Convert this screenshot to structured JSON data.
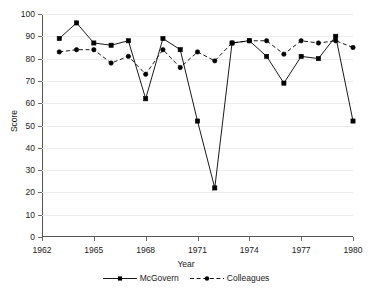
{
  "chart_data": {
    "type": "line",
    "title": "",
    "xlabel": "Year",
    "ylabel": "Score",
    "xlim": [
      1962,
      1980
    ],
    "ylim": [
      0,
      100
    ],
    "grid": true,
    "legend_position": "bottom",
    "xticks": [
      "1962",
      "1965",
      "1968",
      "1971",
      "1974",
      "1977",
      "1980"
    ],
    "xtick_values": [
      1962,
      1965,
      1968,
      1971,
      1974,
      1977,
      1980
    ],
    "yticks": [
      "0",
      "10",
      "20",
      "30",
      "40",
      "50",
      "60",
      "70",
      "80",
      "90",
      "100"
    ],
    "ytick_values": [
      0,
      10,
      20,
      30,
      40,
      50,
      60,
      70,
      80,
      90,
      100
    ],
    "x": [
      1963,
      1964,
      1965,
      1966,
      1967,
      1968,
      1969,
      1970,
      1971,
      1972,
      1973,
      1974,
      1975,
      1976,
      1977,
      1978,
      1979,
      1980
    ],
    "series": [
      {
        "name": "McGovern",
        "style": "solid",
        "marker": "square",
        "color": "#000000",
        "values": [
          89,
          96,
          87,
          86,
          88,
          62,
          89,
          84,
          52,
          22,
          87,
          88,
          81,
          69,
          81,
          80,
          90,
          52
        ]
      },
      {
        "name": "Colleagues",
        "style": "dashed",
        "marker": "circle",
        "color": "#000000",
        "values": [
          83,
          84,
          84,
          78,
          81,
          73,
          84,
          76,
          83,
          79,
          87,
          88,
          88,
          82,
          88,
          87,
          88,
          85
        ]
      }
    ]
  },
  "axes": {
    "x_title": "Year",
    "y_title": "Score"
  },
  "legend": {
    "items": [
      {
        "label": "McGovern"
      },
      {
        "label": "Colleagues"
      }
    ]
  }
}
